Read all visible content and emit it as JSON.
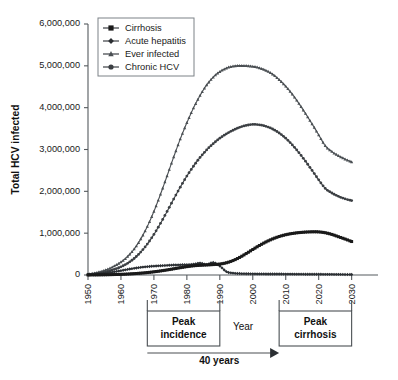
{
  "chart_data": {
    "type": "line",
    "title": "",
    "xlabel": "Year",
    "ylabel": "Total HCV infected",
    "xlim": [
      1950,
      2038
    ],
    "ylim": [
      0,
      6000000
    ],
    "grid": false,
    "legend_position": "top-left",
    "ytick_labels": [
      "0",
      "1,000,000",
      "2,000,000",
      "3,000,000",
      "4,000,000",
      "5,000,000",
      "6,000,000"
    ],
    "ytick_values": [
      0,
      1000000,
      2000000,
      3000000,
      4000000,
      5000000,
      6000000
    ],
    "xtick_labels": [
      "1950",
      "1960",
      "1970",
      "1980",
      "1990",
      "2000",
      "2010",
      "2020",
      "2030"
    ],
    "xtick_values": [
      1950,
      1960,
      1970,
      1980,
      1990,
      2000,
      2010,
      2020,
      2030
    ],
    "x": [
      1950,
      1952,
      1954,
      1956,
      1958,
      1960,
      1962,
      1964,
      1966,
      1968,
      1970,
      1972,
      1974,
      1976,
      1978,
      1980,
      1982,
      1984,
      1986,
      1988,
      1990,
      1992,
      1994,
      1996,
      1998,
      2000,
      2002,
      2004,
      2006,
      2008,
      2010,
      2012,
      2014,
      2016,
      2018,
      2020,
      2022,
      2024,
      2026,
      2028,
      2030
    ],
    "series": [
      {
        "name": "Ever infected",
        "marker": "triangle",
        "color": "#4a4f53",
        "values": [
          20000,
          45000,
          85000,
          140000,
          215000,
          310000,
          440000,
          620000,
          860000,
          1160000,
          1520000,
          1930000,
          2370000,
          2820000,
          3250000,
          3640000,
          3990000,
          4290000,
          4540000,
          4730000,
          4860000,
          4945000,
          4990000,
          5005000,
          5000000,
          4985000,
          4950000,
          4890000,
          4800000,
          4670000,
          4510000,
          4320000,
          4100000,
          3860000,
          3610000,
          3350000,
          3090000,
          2950000,
          2850000,
          2770000,
          2700000
        ]
      },
      {
        "name": "Chronic HCV",
        "marker": "circle",
        "color": "#3b3f43",
        "values": [
          12000,
          28000,
          52000,
          88000,
          136000,
          196000,
          280000,
          395000,
          548000,
          740000,
          970000,
          1235000,
          1520000,
          1815000,
          2100000,
          2365000,
          2600000,
          2810000,
          2990000,
          3140000,
          3270000,
          3375000,
          3460000,
          3530000,
          3575000,
          3600000,
          3590000,
          3555000,
          3490000,
          3395000,
          3270000,
          3110000,
          2925000,
          2720000,
          2500000,
          2275000,
          2070000,
          1960000,
          1880000,
          1820000,
          1780000
        ]
      },
      {
        "name": "Cirrhosis",
        "marker": "square",
        "color": "#1a1a1a",
        "values": [
          1000,
          2000,
          4000,
          7000,
          11000,
          16000,
          23000,
          32000,
          44000,
          58000,
          76000,
          97000,
          121000,
          148000,
          175000,
          200000,
          220000,
          232000,
          240000,
          249000,
          262000,
          292000,
          345000,
          420000,
          512000,
          610000,
          705000,
          790000,
          862000,
          920000,
          963000,
          993000,
          1013000,
          1026000,
          1032000,
          1030000,
          1010000,
          970000,
          915000,
          860000,
          800000
        ]
      },
      {
        "name": "Acute hepatitis",
        "marker": "diamond",
        "color": "#2b2f33",
        "values": [
          8000,
          18000,
          33000,
          52000,
          76000,
          104000,
          133000,
          160000,
          183000,
          200000,
          212000,
          222000,
          230000,
          238000,
          243000,
          248000,
          256000,
          285000,
          250000,
          300000,
          215000,
          80000,
          45000,
          35000,
          30000,
          28000,
          26000,
          25000,
          24000,
          23000,
          22000,
          21000,
          20000,
          19000,
          18000,
          17000,
          16000,
          15000,
          14000,
          13000,
          12000
        ]
      }
    ],
    "annotations": [
      {
        "id": "peak-incidence",
        "label_line1": "Peak",
        "label_line2": "incidence",
        "x_start": 1968,
        "x_end": 1990
      },
      {
        "id": "peak-cirrhosis",
        "label_line1": "Peak",
        "label_line2": "cirrhosis",
        "x_start": 2008,
        "x_end": 2030
      },
      {
        "id": "span-arrow",
        "label": "40 years",
        "x_start": 1968,
        "x_end": 2008
      }
    ]
  },
  "legend": {
    "items": [
      {
        "label": "Cirrhosis",
        "marker": "square"
      },
      {
        "label": "Acute hepatitis",
        "marker": "diamond"
      },
      {
        "label": "Ever infected",
        "marker": "triangle"
      },
      {
        "label": "Chronic HCV",
        "marker": "circle"
      }
    ]
  }
}
